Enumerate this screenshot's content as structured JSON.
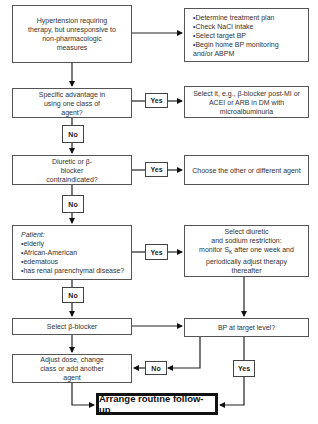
{
  "nodes": {
    "start": "Hypertension requiring therapy, but unresponsive to non-pharmacologic measures",
    "initial_steps": [
      "Determine treatment plan",
      "Check NaCl intake",
      "Select target BP",
      "Begin home BP monitoring and/or ABPM"
    ],
    "q_specific_advantage": "Specific advantage in using one class of agent?",
    "a_select_it": "Select it, e.g., β-blocker post-MI or ACEI or ARB in DM with microalbuminuria",
    "q_contraindicated": "Diuretic or β-blocker contraindicated?",
    "a_choose_other": "Choose the other or different agent",
    "q_patient_title": "Patient:",
    "q_patient_items": [
      "elderly",
      "African-American",
      "edematous",
      "has renal parenchymal disease?"
    ],
    "a_select_diuretic_1": "Select diuretic",
    "a_select_diuretic_2": "and sodium restriction:",
    "a_select_diuretic_3": "monitor S",
    "a_select_diuretic_sub": "K",
    "a_select_diuretic_4": " after one week and",
    "a_select_diuretic_5": "periodically adjust therapy",
    "a_select_diuretic_6": "thereafter",
    "select_beta_blocker": "Select β-blocker",
    "q_bp_target": "BP at target level?",
    "adjust_dose": "Adjust dose, change class or add another agent",
    "final": "Arrange routine follow-up"
  },
  "labels": {
    "yes": "Yes",
    "no": "No"
  }
}
